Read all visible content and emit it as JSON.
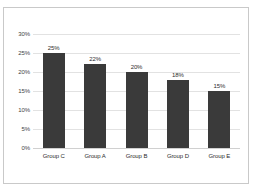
{
  "chart_data": {
    "type": "bar",
    "title": "",
    "subtitle": "",
    "xlabel": "",
    "ylabel": "",
    "categories": [
      "Group C",
      "Group A",
      "Group B",
      "Group D",
      "Group E"
    ],
    "values": [
      25,
      22,
      20,
      18,
      15
    ],
    "data_labels": [
      "25%",
      "22%",
      "20%",
      "18%",
      "15%"
    ],
    "ylim": [
      0,
      30
    ],
    "ytick_values": [
      0,
      5,
      10,
      15,
      20,
      25,
      30
    ],
    "ytick_labels": [
      "0%",
      "5%",
      "10%",
      "15%",
      "20%",
      "25%",
      "30%"
    ],
    "grid": "horizontal",
    "legend": "none",
    "bar_color": "#3a3a3a",
    "gridline_color": "#e2e2e2",
    "axis_color": "#d0d0d0",
    "frame_color": "#c9c9c9",
    "background_color": "#ffffff",
    "label_color": "#2d2d2d"
  }
}
